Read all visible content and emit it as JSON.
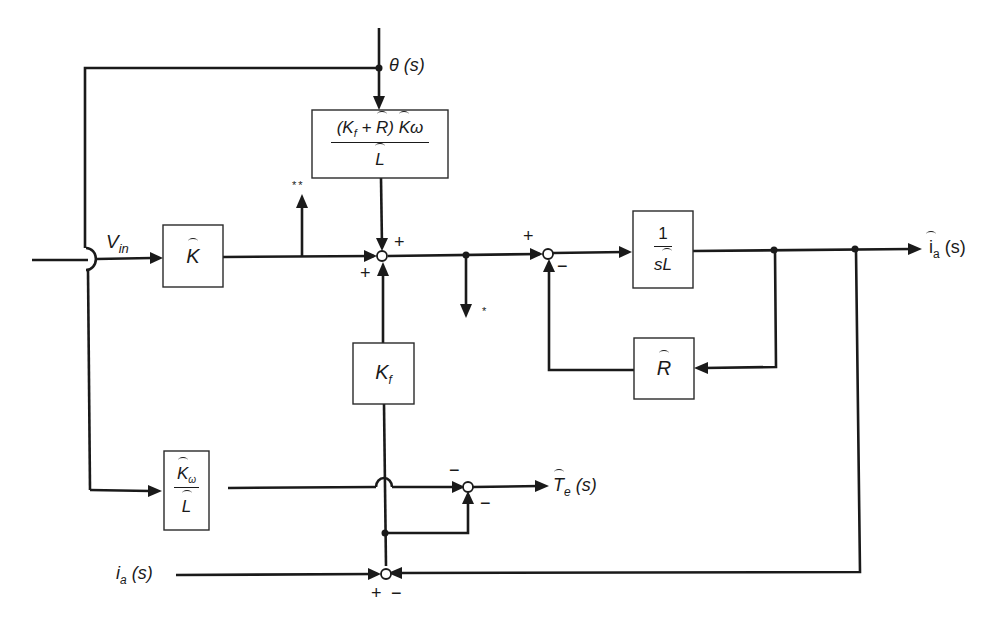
{
  "diagram": {
    "type": "control-block-diagram",
    "inputs": {
      "vin": "V",
      "vin_sub": "in",
      "theta": "θ (s)",
      "ia": "i",
      "ia_sub": "a",
      "ia_arg": " (s)"
    },
    "outputs": {
      "ia_hat": "i",
      "ia_hat_sub": "a",
      "ia_hat_arg": " (s)",
      "te_hat": "T",
      "te_hat_sub": "e",
      "te_hat_arg": " (s)"
    },
    "blocks": {
      "k_hat": "K",
      "feedforward_num": "(K",
      "feedforward_num_sub": "f",
      "feedforward_num_mid": " + ",
      "feedforward_num_r": "R",
      "feedforward_num_close": ")",
      "feedforward_num_k": "K",
      "feedforward_num_omega": "ω",
      "feedforward_den": "L",
      "kf": "K",
      "kf_sub": "f",
      "inv_sl_num": "1",
      "inv_sl_den_s": "s",
      "inv_sl_den_l": "L",
      "r_hat": "R",
      "kw_num": "K",
      "kw_num_sub": "ω",
      "kw_den": "L"
    },
    "signs": {
      "sum1_top": "+",
      "sum1_left": "+",
      "sum2_left": "+",
      "sum2_bottom": "−",
      "sum3_top": "−",
      "sum3_bottom": "−",
      "sum4_left": "+",
      "sum4_right": "−"
    },
    "markers": {
      "double_star": "**",
      "single_star": "*"
    }
  }
}
